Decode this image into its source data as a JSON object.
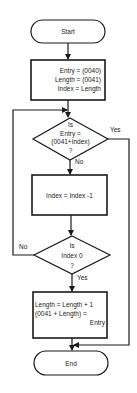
{
  "diagram": {
    "type": "flowchart",
    "colors": {
      "stroke": "#1a1a1a",
      "background": "#ffffff"
    },
    "nodes": {
      "start": {
        "shape": "terminator",
        "label": "Start"
      },
      "init": {
        "shape": "process",
        "lines": [
          "Entry = (0040)",
          "Length = (0041)",
          "Index = Length"
        ]
      },
      "check_entry": {
        "shape": "decision",
        "lines": [
          "Is",
          "Entry =",
          "(0041+Index)",
          "?"
        ]
      },
      "decrement": {
        "shape": "process",
        "lines": [
          "Index = Index -1"
        ]
      },
      "check_index": {
        "shape": "decision",
        "lines": [
          "Is",
          "Index 0",
          "?"
        ]
      },
      "append": {
        "shape": "process",
        "lines": [
          "Length = Length + 1",
          "(0041 + Length) =",
          "Entry"
        ]
      },
      "end": {
        "shape": "terminator",
        "label": "End"
      }
    },
    "edges": {
      "check_entry_yes": "Yes",
      "check_entry_no": "No",
      "check_index_no": "No",
      "check_index_yes": "Yes"
    }
  }
}
